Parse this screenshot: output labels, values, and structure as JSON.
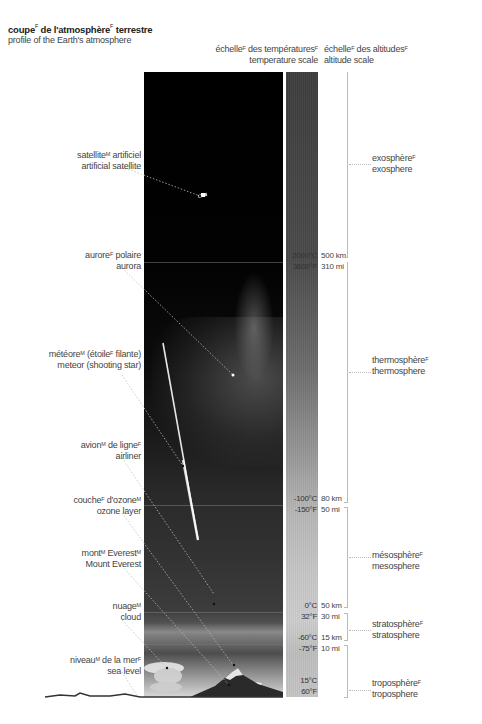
{
  "title": {
    "fr": "coupe",
    "fr_sup": "F",
    "fr_mid": " de l'atmosphère",
    "fr_mid_sup": "F",
    "fr_end": " terrestre",
    "en": "profile of the Earth's atmosphere"
  },
  "headers": {
    "temperature": {
      "fr": "échelle",
      "fr_sup": "F",
      "fr_rest": " des températures",
      "fr_rest_sup": "F",
      "en": "temperature scale"
    },
    "altitude": {
      "fr": "échelle",
      "fr_sup": "F",
      "fr_rest": " des altitudes",
      "fr_rest_sup": "F",
      "en": "altitude scale"
    }
  },
  "left_labels": [
    {
      "id": "satellite",
      "fr": "satellite",
      "fr_sup": "M",
      "fr_rest": " artificiel",
      "fr_rest_sup": "",
      "en": "artificial satellite"
    },
    {
      "id": "aurora",
      "fr": "aurore",
      "fr_sup": "F",
      "fr_rest": " polaire",
      "fr_rest_sup": "",
      "en": "aurora"
    },
    {
      "id": "meteor",
      "fr": "météore",
      "fr_sup": "M",
      "fr_rest": " (étoile",
      "fr_rest_sup": "F",
      "fr_tail": " filante)",
      "en": "meteor (shooting star)"
    },
    {
      "id": "airliner",
      "fr": "avion",
      "fr_sup": "M",
      "fr_rest": " de ligne",
      "fr_rest_sup": "F",
      "en": "airliner"
    },
    {
      "id": "ozone",
      "fr": "couche",
      "fr_sup": "F",
      "fr_rest": " d'ozone",
      "fr_rest_sup": "M",
      "en": "ozone layer"
    },
    {
      "id": "everest",
      "fr": "mont",
      "fr_sup": "M",
      "fr_rest": " Everest",
      "fr_rest_sup": "M",
      "en": "Mount Everest"
    },
    {
      "id": "cloud",
      "fr": "nuage",
      "fr_sup": "M",
      "fr_rest": "",
      "fr_rest_sup": "",
      "en": "cloud"
    },
    {
      "id": "sealevel",
      "fr": "niveau",
      "fr_sup": "M",
      "fr_rest": " de la mer",
      "fr_rest_sup": "F",
      "en": "sea level"
    }
  ],
  "temperature_scale": [
    {
      "c": "2000°C",
      "f": "3600°F"
    },
    {
      "c": "-100°C",
      "f": "-150°F"
    },
    {
      "c": "0°C",
      "f": "32°F"
    },
    {
      "c": "-60°C",
      "f": "-75°F"
    },
    {
      "c": "15°C",
      "f": "60°F"
    }
  ],
  "altitude_scale": [
    {
      "km": "500 km",
      "mi": "310 mi"
    },
    {
      "km": "80 km",
      "mi": "50 mi"
    },
    {
      "km": "50 km",
      "mi": "30 mi"
    },
    {
      "km": "15 km",
      "mi": "10 mi"
    }
  ],
  "layers": [
    {
      "id": "exosphere",
      "fr": "exosphère",
      "fr_sup": "F",
      "en": "exosphere"
    },
    {
      "id": "thermosphere",
      "fr": "thermosphère",
      "fr_sup": "F",
      "en": "thermosphere"
    },
    {
      "id": "mesosphere",
      "fr": "mésosphère",
      "fr_sup": "F",
      "en": "mesosphere"
    },
    {
      "id": "stratosphere",
      "fr": "stratosphère",
      "fr_sup": "F",
      "en": "stratosphere"
    },
    {
      "id": "troposphere",
      "fr": "troposphère",
      "fr_sup": "F",
      "en": "troposphere"
    }
  ],
  "colors": {
    "sky_top": "#000000",
    "temp_scale_top": "#3d3d3d",
    "temp_scale_bottom": "#c5c5c5",
    "label_text": "#444444",
    "bracket": "#bbbbbb"
  }
}
